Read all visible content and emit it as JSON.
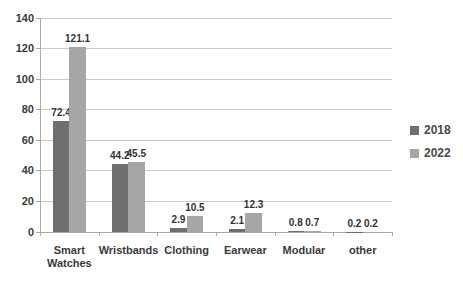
{
  "chart_data": {
    "type": "bar",
    "title": "",
    "xlabel": "",
    "ylabel": "",
    "categories": [
      "Smart Watches",
      "Wristbands",
      "Clothing",
      "Earwear",
      "Modular",
      "other"
    ],
    "series": [
      {
        "name": "2018",
        "color": "#6f6f6f",
        "values": [
          72.4,
          44.2,
          2.9,
          2.1,
          0.8,
          0.2
        ]
      },
      {
        "name": "2022",
        "color": "#a6a6a6",
        "values": [
          121.1,
          45.5,
          10.5,
          12.3,
          0.7,
          0.2
        ]
      }
    ],
    "ylim": [
      0,
      140
    ],
    "yticks": [
      0,
      20,
      40,
      60,
      80,
      100,
      120,
      140
    ],
    "grid": true,
    "legend_position": "right",
    "data_labels": true,
    "data_label_format": "one_decimal"
  },
  "colors": {
    "background": "#ffffff",
    "gridline": "#c9c9c9",
    "axis": "#a9a9a9",
    "text": "#3a3a3a",
    "series_2018": "#6f6f6f",
    "series_2022": "#a6a6a6"
  }
}
